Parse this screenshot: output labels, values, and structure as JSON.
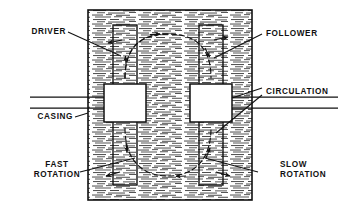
{
  "diagram": {
    "type": "engineering-cross-section",
    "colors": {
      "line": "#111111",
      "fill_white": "#ffffff",
      "hatch": "#2a2a2a",
      "background": "#ffffff"
    },
    "labels": {
      "driver": "DRIVER",
      "follower": "FOLLOWER",
      "circulation": "CIRCULATION",
      "casing": "CASING",
      "fast_rotation_line1": "FAST",
      "fast_rotation_line2": "ROTATION",
      "slow_rotation_line1": "SLOW",
      "slow_rotation_line2": "ROTATION"
    },
    "parts": {
      "casing": {
        "x": 88,
        "y": 10,
        "width": 164,
        "height": 190,
        "fill": "hatched-fluid"
      },
      "driver_shaft": {
        "x": 113,
        "y": 25,
        "width": 24,
        "height": 160
      },
      "follower_shaft": {
        "x": 199,
        "y": 25,
        "width": 24,
        "height": 160
      },
      "driver_rotor": {
        "x": 104,
        "y": 84,
        "width": 42,
        "height": 38,
        "fill": "#ffffff"
      },
      "follower_rotor": {
        "x": 190,
        "y": 84,
        "width": 42,
        "height": 38,
        "fill": "#ffffff"
      },
      "shaft_line_upper_y": 97,
      "shaft_line_lower_y": 108
    },
    "flow": {
      "upper_loop": "clockwise-elliptical-circulation",
      "lower_loop": "clockwise-elliptical-circulation",
      "arrow_count": 8
    }
  }
}
